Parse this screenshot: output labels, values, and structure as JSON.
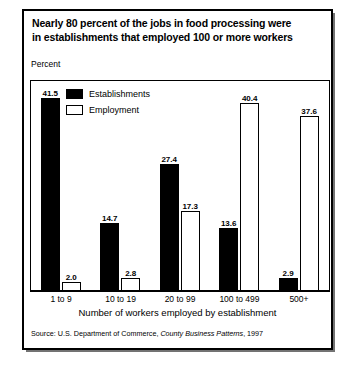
{
  "title": {
    "line1": "Nearly 80 percent of the jobs in food processing were",
    "line2": "in establishments that employed 100 or more workers"
  },
  "axis": {
    "y_label": "Percent",
    "x_title": "Number of workers employed by establishment"
  },
  "legend": {
    "items": [
      {
        "label": "Establishments",
        "swatch": "filled-black-square",
        "color": "#000000"
      },
      {
        "label": "Employment",
        "swatch": "hollow-white-square",
        "color": "#ffffff"
      }
    ]
  },
  "source": {
    "prefix": "Source: U.S. Department of Commerce, ",
    "publication": "County Business Patterns",
    "suffix": ", 1997"
  },
  "chart_data": {
    "type": "bar",
    "title": "Nearly 80 percent of the jobs in food processing were in establishments that employed 100 or more workers",
    "xlabel": "Number of workers employed by establishment",
    "ylabel": "Percent",
    "ylim": [
      0,
      45
    ],
    "grid": false,
    "legend_position": "top-left-inside",
    "categories": [
      "1 to 9",
      "10 to 19",
      "20 to 99",
      "100 to 499",
      "500+"
    ],
    "series": [
      {
        "name": "Establishments",
        "color": "#000000",
        "values": [
          41.5,
          14.7,
          27.4,
          13.6,
          2.9
        ],
        "labels": [
          "41.5",
          "14.7",
          "27.4",
          "13.6",
          "2.9"
        ]
      },
      {
        "name": "Employment",
        "color": "#ffffff",
        "values": [
          2.0,
          2.8,
          17.3,
          40.4,
          37.6
        ],
        "labels": [
          "2.0",
          "2.8",
          "17.3",
          "40.4",
          "37.6"
        ]
      }
    ]
  }
}
